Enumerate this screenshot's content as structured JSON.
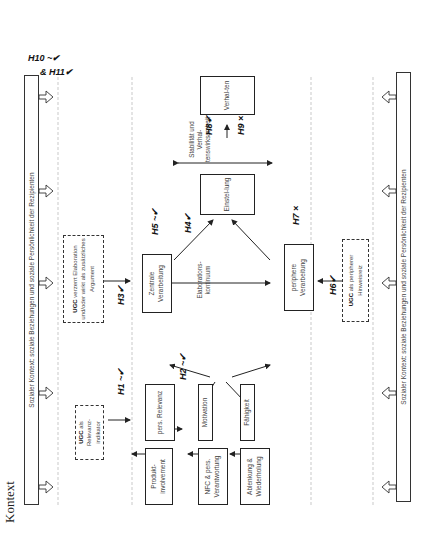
{
  "title": "Kontext",
  "context_bar_top": "Sozialer Kontext: soziale Beziehungen und soziale Persönlichkeit der Rezipienten",
  "context_bar_bottom": "Sozialer Kontext: soziale Beziehungen und soziale Persönlichkeit der Rezipienten",
  "context_hypothesis": {
    "line1": "H10 ~✔",
    "line2": "& H11✔"
  },
  "ugc_boxes": {
    "relevance": {
      "bold": "UGC",
      "text": " als Relevanz-indikator"
    },
    "elaboration": {
      "bold": "UGC",
      "text": " verzerrt Elaboration und/oder wirkt als zusätzliches Argument"
    },
    "peripheral": {
      "bold": "UGC",
      "text": " als peripherer Hinweisreiz"
    }
  },
  "antecedents": [
    {
      "label": "Produkt-involvement"
    },
    {
      "label": "NFC & pers. Verantwortung"
    },
    {
      "label": "Ablenkung & Wiederholung"
    }
  ],
  "factors": [
    {
      "label": "pers. Relevanz"
    },
    {
      "label": "Motivation"
    },
    {
      "label": "Fähigkeit"
    }
  ],
  "processing": {
    "central": "Zentrale Verarbeitung",
    "peripheral": "periphere Verarbeitung",
    "continuum": "Elaborations-kontinuum"
  },
  "outcomes": {
    "attitude": "Einstel-lung",
    "behavior": "Verhal-ten",
    "stability": "Stabilität und Verhal-tenswirksamkeit"
  },
  "hypotheses": {
    "H1": "H1 ~✔",
    "H2": "H2 ~✔",
    "H3": "H3✔",
    "H4": "H4✔",
    "H5": "H5 ~✔",
    "H6": "H6✔",
    "H7": "H7 ×",
    "H8": "H8✔",
    "H9": "H9 ×"
  }
}
